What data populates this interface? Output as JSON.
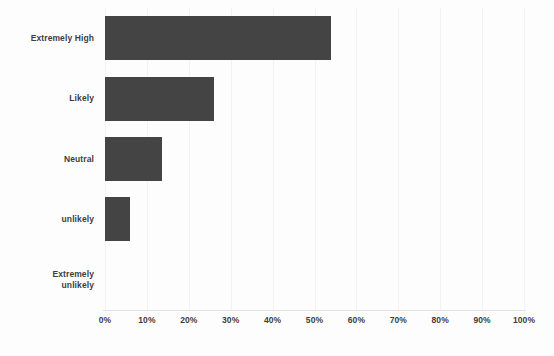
{
  "chart_data": {
    "type": "bar",
    "orientation": "horizontal",
    "title": "",
    "subtitle": "",
    "xlabel": "",
    "ylabel": "",
    "categories": [
      "Extremely High",
      "Likely",
      "Neutral",
      "unlikely",
      "Extremely unlikely"
    ],
    "values": [
      54,
      26,
      13.5,
      6,
      0
    ],
    "value_unit": "%",
    "xlim": [
      0,
      100
    ],
    "xticks": [
      0,
      10,
      20,
      30,
      40,
      50,
      60,
      70,
      80,
      90,
      100
    ],
    "xtick_labels": [
      "0%",
      "10%",
      "20%",
      "30%",
      "40%",
      "50%",
      "60%",
      "70%",
      "80%",
      "90%",
      "100%"
    ],
    "grid": true,
    "grid_axis": "x",
    "legend": false,
    "legend_position": "none",
    "bar_color": "#444444",
    "background_color": "#fdfdfd",
    "gridline_color": "#f2f2f2",
    "axis_line_color": "#e2e2e2",
    "label_color": "#3d3d3d"
  },
  "category_label_lines": [
    [
      "Extremely High"
    ],
    [
      "Likely"
    ],
    [
      "Neutral"
    ],
    [
      "unlikely"
    ],
    [
      "Extremely",
      "unlikely"
    ]
  ]
}
